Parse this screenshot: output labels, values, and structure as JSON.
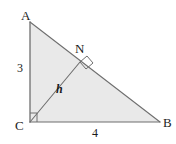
{
  "figure": {
    "name": "right-triangle-with-altitude",
    "background_color": "#ffffff",
    "fill_color": "#e9e9e9",
    "stroke_color": "#6f6f6f",
    "text_color": "#1b1b1b",
    "vertices": {
      "A": {
        "label": "A",
        "x": 30,
        "y": 22
      },
      "B": {
        "label": "B",
        "x": 160,
        "y": 122
      },
      "C": {
        "label": "C",
        "x": 30,
        "y": 122
      }
    },
    "points": {
      "N": {
        "label": "N",
        "x": 80,
        "y": 62
      }
    },
    "labels": {
      "leg_ac": "3",
      "leg_cb": "4",
      "altitude": "h"
    },
    "right_angles": [
      {
        "name": "right-angle-at-c",
        "at": "C"
      },
      {
        "name": "right-angle-at-n",
        "at": "N"
      }
    ]
  }
}
